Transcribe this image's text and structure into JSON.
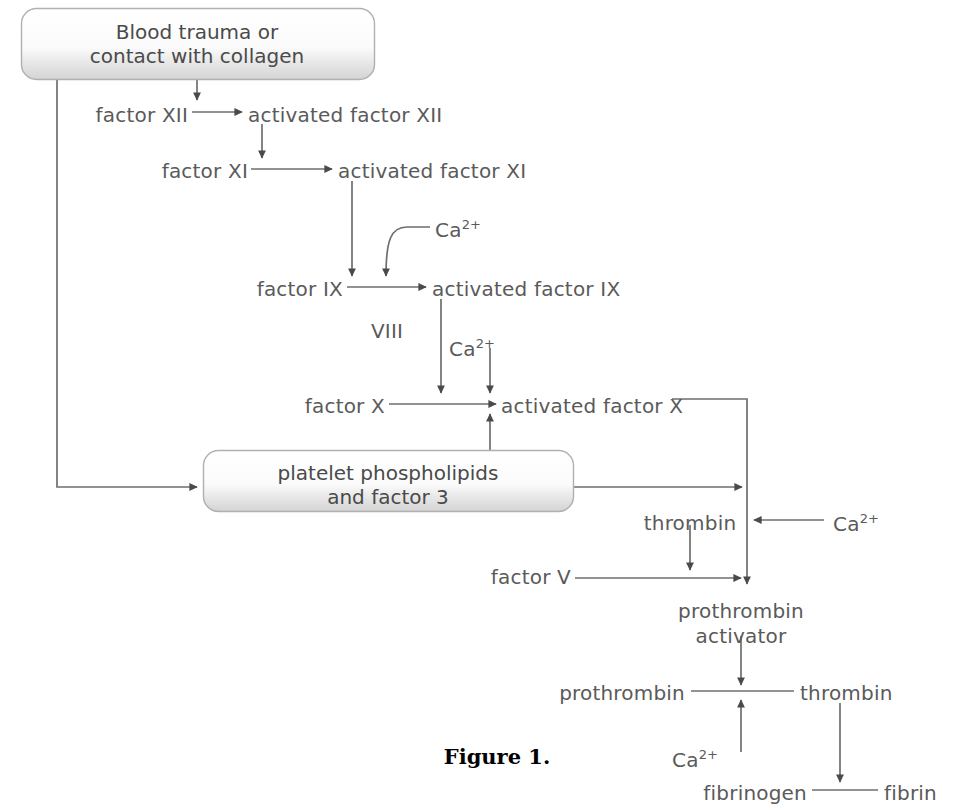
{
  "figure": {
    "caption": "Figure 1.",
    "caption_x": 497,
    "caption_y": 744
  },
  "colors": {
    "text": "#5a5a5a",
    "box_text": "#4a4a4a",
    "line": "#6e6e6e",
    "line_dark": "#4a4a4a",
    "box_border": "#b8b8b8",
    "box_fill_top": "#ffffff",
    "box_fill_bottom": "#d8d8d8",
    "caption": "#000000",
    "background": "#ffffff"
  },
  "boxes": [
    {
      "name": "blood-trauma-box",
      "lines": [
        "Blood trauma or",
        "contact with collagen"
      ],
      "x": 21,
      "y": 8,
      "w": 353,
      "h": 72,
      "cx": 197,
      "text_y": 20
    },
    {
      "name": "platelet-phospholipids-box",
      "lines": [
        "platelet phospholipids",
        "and factor 3"
      ],
      "x": 203,
      "y": 450,
      "w": 370,
      "h": 62,
      "cx": 388,
      "text_y": 461
    }
  ],
  "labels": [
    {
      "name": "factor-xii-label",
      "text": "factor XII",
      "x": 188,
      "y": 104,
      "align": "r"
    },
    {
      "name": "activated-factor-xii-label",
      "text": "activated factor XII",
      "x": 248,
      "y": 104,
      "align": "l"
    },
    {
      "name": "factor-xi-label",
      "text": "factor XI",
      "x": 248,
      "y": 160,
      "align": "r"
    },
    {
      "name": "activated-factor-xi-label",
      "text": "activated factor XI",
      "x": 338,
      "y": 160,
      "align": "l"
    },
    {
      "name": "ca-ion-1-label",
      "text": "Ca",
      "sup": "2+",
      "x": 435,
      "y": 218,
      "align": "l"
    },
    {
      "name": "factor-ix-label",
      "text": "factor IX",
      "x": 343,
      "y": 278,
      "align": "r"
    },
    {
      "name": "activated-factor-ix-label",
      "text": "activated factor IX",
      "x": 432,
      "y": 278,
      "align": "l"
    },
    {
      "name": "factor-viii-label",
      "text": "VIII",
      "x": 387,
      "y": 320,
      "align": "c"
    },
    {
      "name": "ca-ion-2-label",
      "text": "Ca",
      "sup": "2+",
      "x": 449,
      "y": 337,
      "align": "l"
    },
    {
      "name": "factor-x-label",
      "text": "factor X",
      "x": 385,
      "y": 395,
      "align": "r"
    },
    {
      "name": "activated-factor-x-label",
      "text": "activated factor X",
      "x": 501,
      "y": 395,
      "align": "l"
    },
    {
      "name": "thrombin-upper-label",
      "text": "thrombin",
      "x": 690,
      "y": 512,
      "align": "c"
    },
    {
      "name": "ca-ion-3-label",
      "text": "Ca",
      "sup": "2+",
      "x": 833,
      "y": 512,
      "align": "l"
    },
    {
      "name": "factor-v-label",
      "text": "factor V",
      "x": 571,
      "y": 566,
      "align": "r"
    },
    {
      "name": "prothrombin-activator-l1",
      "text": "prothrombin",
      "x": 741,
      "y": 600,
      "align": "c"
    },
    {
      "name": "prothrombin-activator-l2",
      "text": "activator",
      "x": 741,
      "y": 625,
      "align": "c"
    },
    {
      "name": "prothrombin-label",
      "text": "prothrombin",
      "x": 685,
      "y": 682,
      "align": "r"
    },
    {
      "name": "thrombin-lower-label",
      "text": "thrombin",
      "x": 800,
      "y": 682,
      "align": "l"
    },
    {
      "name": "ca-ion-4-label",
      "text": "Ca",
      "sup": "2+",
      "x": 672,
      "y": 748,
      "align": "l"
    },
    {
      "name": "fibrinogen-label",
      "text": "fibrinogen",
      "x": 807,
      "y": 782,
      "align": "r"
    },
    {
      "name": "fibrin-label",
      "text": "fibrin",
      "x": 884,
      "y": 782,
      "align": "l"
    }
  ],
  "connections": [
    {
      "name": "box-to-factor-xii-arrow",
      "from": "Blood trauma or contact with collagen",
      "to": "factor XII activation point"
    },
    {
      "name": "factor-xii-to-activated-arrow",
      "from": "factor XII",
      "to": "activated factor XII"
    },
    {
      "name": "activated-xii-down-arrow",
      "from": "activated factor XII",
      "to": "factor XI activation point"
    },
    {
      "name": "factor-xi-to-activated-arrow",
      "from": "factor XI",
      "to": "activated factor XI"
    },
    {
      "name": "activated-xi-down-arrow",
      "from": "activated factor XI",
      "to": "factor IX activation point"
    },
    {
      "name": "ca-curve-to-factor-ix-arrow",
      "from": "Ca 2+",
      "to": "factor IX activation point"
    },
    {
      "name": "factor-ix-to-activated-arrow",
      "from": "factor IX",
      "to": "activated factor IX"
    },
    {
      "name": "activated-ix-down-arrow",
      "from": "activated factor IX",
      "to": "factor X activation point"
    },
    {
      "name": "ca-down-to-factor-x-arrow",
      "from": "Ca 2+",
      "to": "factor X activation point"
    },
    {
      "name": "factor-x-to-activated-arrow",
      "from": "factor X",
      "to": "activated factor X"
    },
    {
      "name": "box-left-to-platelet-arrow",
      "from": "Blood trauma or contact with collagen",
      "to": "platelet phospholipids and factor 3"
    },
    {
      "name": "platelet-up-to-factor-x-arrow",
      "from": "platelet phospholipids and factor 3",
      "to": "activated factor X"
    },
    {
      "name": "platelet-right-arrow",
      "from": "platelet phospholipids and factor 3",
      "to": "prothrombin activator line"
    },
    {
      "name": "activated-x-down-to-activator",
      "from": "activated factor X",
      "to": "prothrombin activator"
    },
    {
      "name": "thrombin-down-arrow",
      "from": "thrombin",
      "to": "factor V line"
    },
    {
      "name": "ca-left-arrow",
      "from": "Ca 2+",
      "to": "prothrombin activator line"
    },
    {
      "name": "factor-v-right-arrow",
      "from": "factor V",
      "to": "prothrombin activator"
    },
    {
      "name": "activator-down-arrow",
      "from": "prothrombin activator",
      "to": "prothrombin to thrombin line"
    },
    {
      "name": "prothrombin-to-thrombin-line",
      "from": "prothrombin",
      "to": "thrombin"
    },
    {
      "name": "ca-up-arrow",
      "from": "Ca 2+",
      "to": "prothrombin to thrombin line"
    },
    {
      "name": "thrombin-down-to-fibrin-arrow",
      "from": "thrombin",
      "to": "fibrinogen to fibrin line"
    },
    {
      "name": "fibrinogen-to-fibrin-line",
      "from": "fibrinogen",
      "to": "fibrin"
    }
  ]
}
